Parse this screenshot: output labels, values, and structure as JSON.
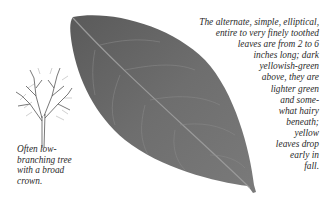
{
  "leaf_illustration": {
    "icon": "leaf-icon",
    "color": "#6b6b6b"
  },
  "tree_illustration": {
    "icon": "tree-silhouette-icon"
  },
  "tree_caption": {
    "lines": [
      "Often low-",
      "branching tree",
      "with a broad",
      "crown."
    ]
  },
  "leaf_caption": {
    "lines": [
      "The alternate, simple, elliptical,",
      "entire to very finely toothed",
      "leaves are from 2 to 6",
      "inches long; dark",
      "yellowish-green",
      "above, they are",
      "lighter green",
      "and some-",
      "what hairy",
      "beneath;",
      "yellow",
      "leaves drop",
      "early in",
      "fall."
    ]
  }
}
